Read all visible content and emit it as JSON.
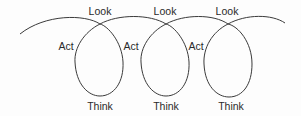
{
  "diagram": {
    "type": "look-think-act spiral",
    "stroke_color": "#3a3a3a",
    "text_color": "#2a2a2a",
    "background": "#fdfdfd",
    "cycles": [
      {
        "look": "Look",
        "act": "Act",
        "think": "Think"
      },
      {
        "look": "Look",
        "act": "Act",
        "think": "Think"
      },
      {
        "look": "Look",
        "act": "Act",
        "think": "Think"
      }
    ]
  }
}
